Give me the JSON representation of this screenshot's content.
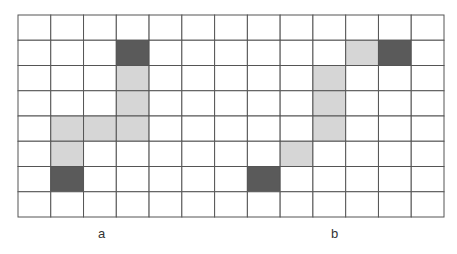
{
  "grid": {
    "rows": 8,
    "cols": 13,
    "line_color": "#555555",
    "empty_color": "#ffffff",
    "dark_color": "#5a5a5a",
    "light_color": "#d6d6d6"
  },
  "panels": [
    {
      "label": "a",
      "dark_cells": [
        [
          1,
          3
        ],
        [
          6,
          1
        ]
      ],
      "light_cells": [
        [
          2,
          3
        ],
        [
          3,
          3
        ],
        [
          4,
          1
        ],
        [
          4,
          2
        ],
        [
          4,
          3
        ],
        [
          5,
          1
        ]
      ]
    },
    {
      "label": "b",
      "dark_cells": [
        [
          1,
          11
        ],
        [
          6,
          7
        ]
      ],
      "light_cells": [
        [
          1,
          10
        ],
        [
          2,
          9
        ],
        [
          3,
          9
        ],
        [
          4,
          9
        ],
        [
          5,
          8
        ]
      ]
    }
  ]
}
